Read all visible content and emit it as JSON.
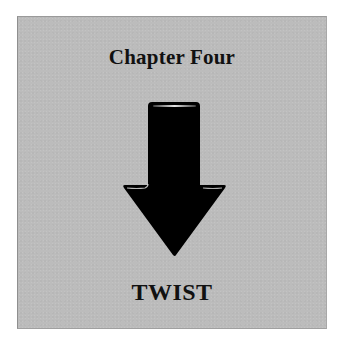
{
  "card": {
    "chapter_label": "Chapter Four",
    "section_label": "TWIST",
    "icon": "arrow-down-icon"
  },
  "colors": {
    "page_background": "#ffffff",
    "card_background": "#bcbcbc",
    "arrow_fill": "#000000",
    "arrow_highlight": "#e8e8e8",
    "text": "#111111"
  }
}
